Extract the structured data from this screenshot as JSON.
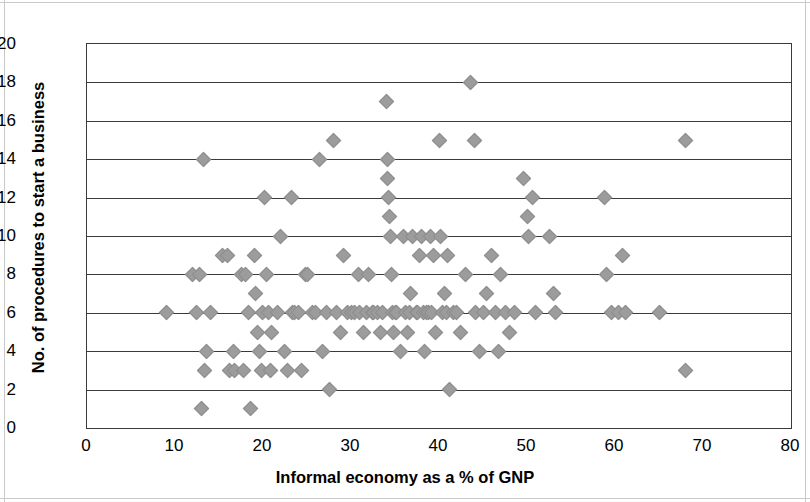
{
  "chart_data": {
    "type": "scatter",
    "title": "",
    "xlabel": "Informal economy as a % of GNP",
    "ylabel": "No. of procedures to start a business",
    "xlim": [
      0,
      80
    ],
    "ylim": [
      0,
      20
    ],
    "xticks": [
      0,
      10,
      20,
      30,
      40,
      50,
      60,
      70,
      80
    ],
    "yticks": [
      0,
      2,
      4,
      6,
      8,
      10,
      12,
      14,
      16,
      18,
      20
    ],
    "grid": "horizontal",
    "legend": "none",
    "marker": {
      "shape": "diamond",
      "color": "#9c9c9c",
      "size": 11
    },
    "series": [
      {
        "name": "Countries",
        "points": [
          [
            9.0,
            6
          ],
          [
            12.0,
            8
          ],
          [
            12.8,
            8
          ],
          [
            12.4,
            6
          ],
          [
            13.2,
            14
          ],
          [
            13.0,
            1
          ],
          [
            13.3,
            3
          ],
          [
            13.6,
            4
          ],
          [
            14.0,
            6
          ],
          [
            15.4,
            9
          ],
          [
            16.0,
            9
          ],
          [
            16.2,
            3
          ],
          [
            16.6,
            4
          ],
          [
            16.8,
            3
          ],
          [
            17.5,
            8
          ],
          [
            17.8,
            3
          ],
          [
            18.0,
            8
          ],
          [
            18.4,
            6
          ],
          [
            18.6,
            1
          ],
          [
            19.0,
            9
          ],
          [
            19.2,
            7
          ],
          [
            19.4,
            5
          ],
          [
            19.6,
            4
          ],
          [
            19.8,
            3
          ],
          [
            19.9,
            6
          ],
          [
            20.2,
            12
          ],
          [
            20.4,
            8
          ],
          [
            20.6,
            6
          ],
          [
            20.8,
            3
          ],
          [
            21.0,
            5
          ],
          [
            21.6,
            6
          ],
          [
            22.0,
            10
          ],
          [
            22.4,
            4
          ],
          [
            22.8,
            3
          ],
          [
            23.2,
            12
          ],
          [
            23.4,
            6
          ],
          [
            23.6,
            6
          ],
          [
            24.0,
            6
          ],
          [
            24.4,
            3
          ],
          [
            24.8,
            8
          ],
          [
            25.0,
            8
          ],
          [
            25.6,
            6
          ],
          [
            26.0,
            6
          ],
          [
            26.4,
            14
          ],
          [
            26.8,
            4
          ],
          [
            27.2,
            6
          ],
          [
            27.6,
            2
          ],
          [
            28.0,
            15
          ],
          [
            28.4,
            6
          ],
          [
            28.8,
            5
          ],
          [
            29.2,
            9
          ],
          [
            29.6,
            6
          ],
          [
            30.0,
            6
          ],
          [
            30.4,
            6
          ],
          [
            30.8,
            8
          ],
          [
            31.0,
            6
          ],
          [
            31.4,
            5
          ],
          [
            31.8,
            6
          ],
          [
            32.0,
            8
          ],
          [
            32.4,
            6
          ],
          [
            32.6,
            6
          ],
          [
            33.0,
            6
          ],
          [
            33.4,
            5
          ],
          [
            33.6,
            6
          ],
          [
            34.0,
            17
          ],
          [
            34.1,
            14
          ],
          [
            34.2,
            13
          ],
          [
            34.3,
            12
          ],
          [
            34.4,
            11
          ],
          [
            34.5,
            10
          ],
          [
            34.6,
            8
          ],
          [
            34.7,
            6
          ],
          [
            34.8,
            5
          ],
          [
            35.0,
            6
          ],
          [
            35.2,
            6
          ],
          [
            35.6,
            4
          ],
          [
            36.0,
            10
          ],
          [
            36.2,
            6
          ],
          [
            36.4,
            5
          ],
          [
            36.6,
            6
          ],
          [
            36.8,
            7
          ],
          [
            37.0,
            10
          ],
          [
            37.4,
            6
          ],
          [
            37.6,
            6
          ],
          [
            37.8,
            9
          ],
          [
            38.0,
            10
          ],
          [
            38.2,
            6
          ],
          [
            38.4,
            4
          ],
          [
            38.6,
            6
          ],
          [
            38.8,
            6
          ],
          [
            39.0,
            10
          ],
          [
            39.2,
            6
          ],
          [
            39.4,
            9
          ],
          [
            39.6,
            5
          ],
          [
            40.0,
            15
          ],
          [
            40.2,
            10
          ],
          [
            40.4,
            6
          ],
          [
            40.6,
            7
          ],
          [
            40.8,
            6
          ],
          [
            41.0,
            9
          ],
          [
            41.2,
            2
          ],
          [
            41.6,
            6
          ],
          [
            42.0,
            6
          ],
          [
            42.4,
            5
          ],
          [
            43.0,
            8
          ],
          [
            43.6,
            18
          ],
          [
            44.0,
            15
          ],
          [
            44.2,
            6
          ],
          [
            44.6,
            4
          ],
          [
            45.0,
            6
          ],
          [
            45.4,
            7
          ],
          [
            46.0,
            9
          ],
          [
            46.4,
            6
          ],
          [
            46.8,
            4
          ],
          [
            47.0,
            8
          ],
          [
            47.6,
            6
          ],
          [
            48.0,
            5
          ],
          [
            48.6,
            6
          ],
          [
            49.6,
            13
          ],
          [
            50.0,
            11
          ],
          [
            50.2,
            10
          ],
          [
            50.6,
            12
          ],
          [
            51.0,
            6
          ],
          [
            52.6,
            10
          ],
          [
            53.0,
            7
          ],
          [
            53.2,
            6
          ],
          [
            58.8,
            12
          ],
          [
            59.0,
            8
          ],
          [
            59.6,
            6
          ],
          [
            60.4,
            6
          ],
          [
            60.8,
            9
          ],
          [
            61.2,
            6
          ],
          [
            65.0,
            6
          ],
          [
            68.0,
            15
          ],
          [
            68.0,
            3
          ]
        ]
      }
    ]
  },
  "axes": {
    "y_title": "No. of procedures to start a business",
    "x_title": "Informal economy as a % of GNP",
    "y_tick_labels": [
      "20",
      "18",
      "16",
      "14",
      "12",
      "10",
      "8",
      "6",
      "4",
      "2",
      "0"
    ],
    "x_tick_labels": [
      "0",
      "10",
      "20",
      "30",
      "40",
      "50",
      "60",
      "70",
      "80"
    ]
  }
}
